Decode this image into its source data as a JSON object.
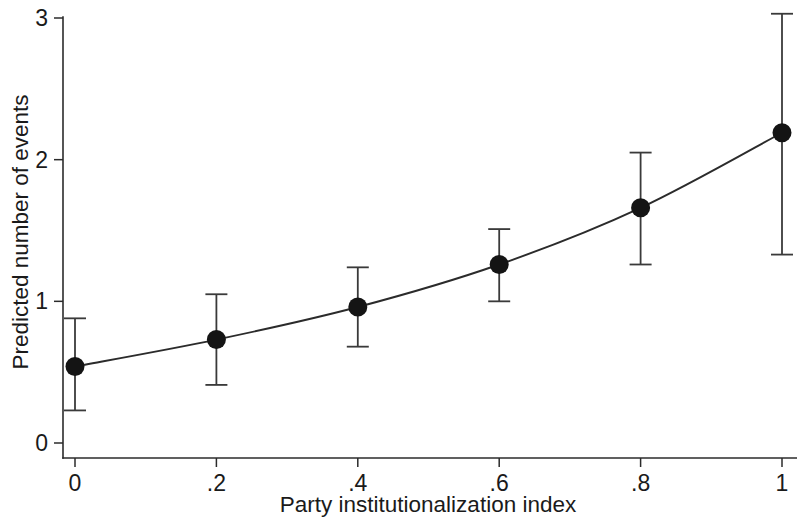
{
  "chart_data": {
    "type": "line",
    "title": "",
    "subtitle": "",
    "xlabel": "Party institutionalization index",
    "ylabel": "Predicted number of events",
    "xlim": [
      0,
      1
    ],
    "ylim": [
      0,
      3
    ],
    "xticks": [
      0,
      0.2,
      0.4,
      0.6,
      0.8,
      1
    ],
    "xticklabels": [
      "0",
      ".2",
      ".4",
      ".6",
      ".8",
      "1"
    ],
    "yticks": [
      0,
      1,
      2,
      3
    ],
    "yticklabels": [
      "0",
      "1",
      "2",
      "3"
    ],
    "grid": false,
    "legend": false,
    "legend_position": "none",
    "marker": "filled-circle",
    "error_bars": "vertical-capped",
    "x": [
      0,
      0.2,
      0.4,
      0.6,
      0.8,
      1
    ],
    "values": [
      0.54,
      0.73,
      0.96,
      1.26,
      1.66,
      2.19
    ],
    "ci_low": [
      0.23,
      0.41,
      0.68,
      1.0,
      1.26,
      1.33
    ],
    "ci_high": [
      0.88,
      1.05,
      1.24,
      1.51,
      2.05,
      3.03
    ],
    "series": [
      {
        "name": "Predicted number of events",
        "values": [
          0.54,
          0.73,
          0.96,
          1.26,
          1.66,
          2.19
        ],
        "ci_low": [
          0.23,
          0.41,
          0.68,
          1.0,
          1.26,
          1.33
        ],
        "ci_high": [
          0.88,
          1.05,
          1.24,
          1.51,
          2.05,
          3.03
        ]
      }
    ],
    "colors": {
      "line": "#2b2b2b",
      "marker": "#141414",
      "error_bar": "#3a3a3a",
      "axis": "#2b2b2b",
      "background": "#ffffff"
    }
  }
}
